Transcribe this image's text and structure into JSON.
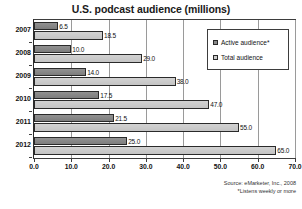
{
  "chart_data": {
    "type": "bar",
    "orientation": "horizontal",
    "title": "U.S. podcast audience (millions)",
    "xlabel": "",
    "ylabel": "",
    "categories": [
      "2007",
      "2008",
      "2009",
      "2010",
      "2011",
      "2012"
    ],
    "series": [
      {
        "name": "Active audience*",
        "color": "#8a8a8a",
        "values": [
          6.5,
          10.0,
          14.0,
          17.5,
          21.5,
          25.0
        ],
        "value_labels": [
          "6.5",
          "10.0",
          "14.0",
          "17.5",
          "21.5",
          "25.0"
        ]
      },
      {
        "name": "Total audience",
        "color": "#cccccc",
        "values": [
          18.5,
          29.0,
          38.0,
          47.0,
          55.0,
          65.0
        ],
        "value_labels": [
          "18.5",
          "29.0",
          "38.0",
          "47.0",
          "55.0",
          "65.0"
        ]
      }
    ],
    "xlim": [
      0.0,
      70.0
    ],
    "xticks": [
      0.0,
      10.0,
      20.0,
      30.0,
      40.0,
      50.0,
      60.0,
      70.0
    ],
    "xtick_labels": [
      "0.0",
      "10.0",
      "20.0",
      "30.0",
      "40.0",
      "50.0",
      "60.0",
      "70.0"
    ],
    "grid": true,
    "grid_axis": "x",
    "legend_position": "upper right",
    "legend_entries": [
      "Active audience*",
      "Total audience"
    ],
    "annotations": [
      "Source: eMarketer, Inc., 2008",
      "*Listens weekly or more"
    ]
  },
  "footnotes": {
    "source": "Source: eMarketer, Inc., 2008",
    "note": "*Listens weekly or more"
  }
}
